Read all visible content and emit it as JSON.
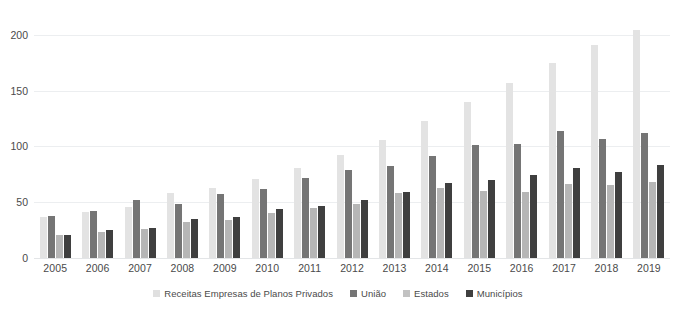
{
  "chart_data": {
    "type": "bar",
    "title": "",
    "subtitle": "",
    "xlabel": "",
    "ylabel": "",
    "ylim": [
      0,
      215
    ],
    "yticks": [
      0,
      50,
      100,
      150,
      200
    ],
    "grid": true,
    "legend_position": "bottom",
    "categories": [
      "2005",
      "2006",
      "2007",
      "2008",
      "2009",
      "2010",
      "2011",
      "2012",
      "2013",
      "2014",
      "2015",
      "2016",
      "2017",
      "2018",
      "2019"
    ],
    "series": [
      {
        "name": "Receitas Empresas de Planos Privados",
        "color": "#e3e3e3",
        "values": [
          37,
          41,
          46,
          58,
          63,
          71,
          81,
          92,
          106,
          123,
          140,
          157,
          175,
          191,
          204
        ]
      },
      {
        "name": "União",
        "color": "#757575",
        "values": [
          38,
          42,
          52,
          48,
          57,
          62,
          72,
          79,
          82,
          91,
          101,
          102,
          114,
          107,
          112
        ]
      },
      {
        "name": "Estados",
        "color": "#b6b6b6",
        "values": [
          21,
          23,
          26,
          32,
          34,
          40,
          45,
          48,
          58,
          63,
          60,
          59,
          66,
          65,
          68
        ]
      },
      {
        "name": "Municípios",
        "color": "#3f3f3f",
        "values": [
          21,
          25,
          27,
          35,
          37,
          44,
          47,
          52,
          59,
          67,
          70,
          74,
          81,
          77,
          83
        ]
      }
    ]
  },
  "axis": {
    "y_tick_labels": [
      "200",
      "150",
      "100",
      "50",
      "0"
    ]
  },
  "legend": {
    "items": [
      {
        "label": "Receitas Empresas de Planos Privados",
        "swatch": "legend-swatch-series-0"
      },
      {
        "label": "União",
        "swatch": "legend-swatch-series-1"
      },
      {
        "label": "Estados",
        "swatch": "legend-swatch-series-2"
      },
      {
        "label": "Municípios",
        "swatch": "legend-swatch-series-3"
      }
    ]
  }
}
